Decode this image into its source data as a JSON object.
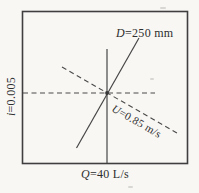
{
  "figure": {
    "labels": {
      "diameter": {
        "symbol": "D",
        "rest": "=250 mm"
      },
      "hydraulic_gradient": {
        "symbol": "i",
        "rest": "=0.005"
      },
      "velocity": {
        "symbol": "U",
        "rest": "=0.85 m/s"
      },
      "discharge": {
        "symbol": "Q",
        "rest": "=40 L/s"
      }
    },
    "lines": [
      {
        "name": "discharge-line",
        "quantity": "Q=40 L/s",
        "style": "solid",
        "orientation": "vertical"
      },
      {
        "name": "diameter-line",
        "quantity": "D=250 mm",
        "style": "solid",
        "orientation": "steep-diagonal"
      },
      {
        "name": "gradient-line",
        "quantity": "i=0.005",
        "style": "dashed",
        "orientation": "horizontal"
      },
      {
        "name": "velocity-line",
        "quantity": "U=0.85 m/s",
        "style": "dashed",
        "orientation": "shallow-diagonal"
      }
    ],
    "colors": {
      "ink": "#3f3f3f",
      "paper": "#f8f7f4",
      "text": "#2e2e2e"
    }
  }
}
